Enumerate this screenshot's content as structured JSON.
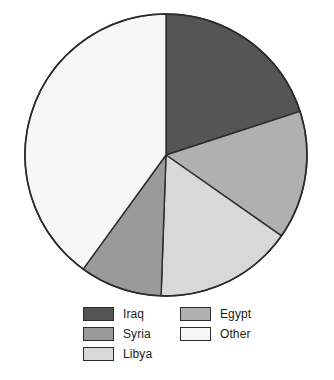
{
  "chart_data": {
    "type": "pie",
    "title": "",
    "subtitle": "",
    "xlabel": "",
    "ylabel": "",
    "legend_position": "bottom",
    "grid": false,
    "start_angle_deg": 0,
    "direction": "clockwise",
    "center": {
      "x": 166,
      "y": 155
    },
    "radius": 141,
    "labels": [
      "Iraq",
      "Egypt",
      "Libya",
      "Syria",
      "Other"
    ],
    "values": [
      20.0,
      14.7,
      15.8,
      9.5,
      40.0
    ],
    "slices": [
      {
        "label": "Iraq",
        "value": 20.0,
        "start_deg": 0,
        "end_deg": 72,
        "color": "#555555"
      },
      {
        "label": "Egypt",
        "value": 14.7,
        "start_deg": 72,
        "end_deg": 125,
        "color": "#b0b0b0"
      },
      {
        "label": "Libya",
        "value": 15.8,
        "start_deg": 125,
        "end_deg": 182,
        "color": "#d8d8d8"
      },
      {
        "label": "Syria",
        "value": 9.5,
        "start_deg": 182,
        "end_deg": 216,
        "color": "#9a9a9a"
      },
      {
        "label": "Other",
        "value": 40.0,
        "start_deg": 216,
        "end_deg": 360,
        "color": "#f7f7f7"
      }
    ],
    "stroke_color": "#2b2b2b"
  },
  "legend": {
    "columns": [
      {
        "name": "left-column",
        "entries": [
          {
            "label": "Iraq",
            "color": "#555555"
          },
          {
            "label": "Syria",
            "color": "#9a9a9a"
          },
          {
            "label": "Libya",
            "color": "#d8d8d8"
          }
        ]
      },
      {
        "name": "right-column",
        "entries": [
          {
            "label": "Egypt",
            "color": "#b0b0b0"
          },
          {
            "label": "Other",
            "color": "#f7f7f7"
          }
        ]
      }
    ]
  }
}
